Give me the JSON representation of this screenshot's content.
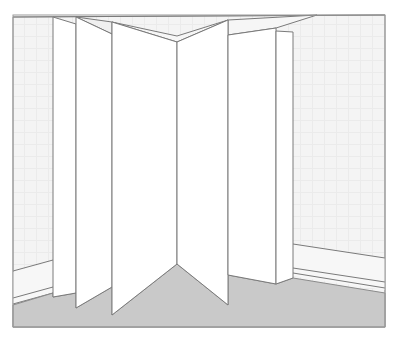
{
  "illustration": {
    "subject": "folding screen room divider standing in a room corner",
    "colors": {
      "background": "#ffffff",
      "wall": "#f3f3f3",
      "wall_grid": "#e8e8e8",
      "panel": "#ffffff",
      "floor": "#c9c9c9",
      "outline": "#7a7a7a",
      "frame": "#9a9a9a"
    },
    "panel_count": 6
  }
}
